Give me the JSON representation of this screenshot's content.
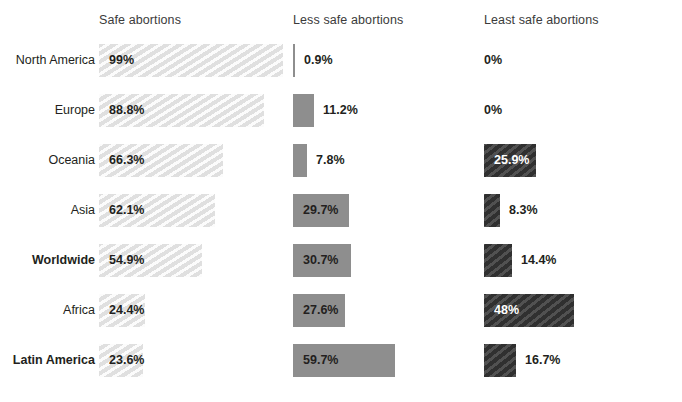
{
  "chart_data": {
    "type": "bar",
    "title": "",
    "subtitle": "",
    "xlabel": "",
    "ylabel": "",
    "orientation": "horizontal",
    "grid": false,
    "legend_position": "top (column headers)",
    "xlim": [
      0,
      100
    ],
    "value_unit": "%",
    "categories": [
      "North America",
      "Europe",
      "Oceania",
      "Asia",
      "Worldwide",
      "Africa",
      "Latin America"
    ],
    "highlighted_categories": [
      "Worldwide",
      "Latin America"
    ],
    "series": [
      {
        "name": "Safe abortions",
        "color": "#e9e9e9",
        "values": [
          99,
          88.8,
          66.3,
          62.1,
          54.9,
          24.4,
          23.6
        ],
        "labels": [
          "99%",
          "88.8%",
          "66.3%",
          "62.1%",
          "54.9%",
          "24.4%",
          "23.6%"
        ]
      },
      {
        "name": "Less safe abortions",
        "color": "#8e8e8e",
        "values": [
          0.9,
          11.2,
          7.8,
          29.7,
          30.7,
          27.6,
          59.7
        ],
        "labels": [
          "0.9%",
          "11.2%",
          "7.8%",
          "29.7%",
          "30.7%",
          "27.6%",
          "59.7%"
        ]
      },
      {
        "name": "Least safe abortions",
        "color": "#3c3c3c",
        "values": [
          0,
          0,
          25.9,
          8.3,
          14.4,
          48,
          16.7
        ],
        "labels": [
          "0%",
          "0%",
          "25.9%",
          "8.3%",
          "14.4%",
          "48%",
          "16.7%"
        ]
      }
    ]
  },
  "headers": {
    "safe": "Safe abortions",
    "less_safe": "Less safe abortions",
    "least_safe": "Least safe abortions"
  },
  "rows": [
    {
      "label": "North America",
      "safe": {
        "value": "99%",
        "width": 184,
        "placement": "inside"
      },
      "less": {
        "value": "0.9%",
        "width": 2,
        "placement": "outside",
        "offset": 11
      },
      "least": {
        "value": "0%",
        "width": 0,
        "placement": "outside",
        "offset": 0
      }
    },
    {
      "label": "Europe",
      "safe": {
        "value": "88.8%",
        "width": 165,
        "placement": "inside"
      },
      "less": {
        "value": "11.2%",
        "width": 21,
        "placement": "outside",
        "offset": 30
      },
      "least": {
        "value": "0%",
        "width": 0,
        "placement": "outside",
        "offset": 0
      }
    },
    {
      "label": "Oceania",
      "safe": {
        "value": "66.3%",
        "width": 124,
        "placement": "inside"
      },
      "less": {
        "value": "7.8%",
        "width": 14,
        "placement": "outside",
        "offset": 23
      },
      "least": {
        "value": "25.9%",
        "width": 52,
        "placement": "inside"
      }
    },
    {
      "label": "Asia",
      "safe": {
        "value": "62.1%",
        "width": 116,
        "placement": "inside"
      },
      "less": {
        "value": "29.7%",
        "width": 56,
        "placement": "inside"
      },
      "least": {
        "value": "8.3%",
        "width": 16,
        "placement": "outside",
        "offset": 25
      }
    },
    {
      "label": "Worldwide",
      "safe": {
        "value": "54.9%",
        "width": 103,
        "placement": "inside"
      },
      "less": {
        "value": "30.7%",
        "width": 58,
        "placement": "inside"
      },
      "least": {
        "value": "14.4%",
        "width": 28,
        "placement": "outside",
        "offset": 37
      }
    },
    {
      "label": "Africa",
      "safe": {
        "value": "24.4%",
        "width": 46,
        "placement": "inside"
      },
      "less": {
        "value": "27.6%",
        "width": 52,
        "placement": "inside"
      },
      "least": {
        "value": "48%",
        "width": 90,
        "placement": "inside"
      }
    },
    {
      "label": "Latin America",
      "safe": {
        "value": "23.6%",
        "width": 44,
        "placement": "inside"
      },
      "less": {
        "value": "59.7%",
        "width": 102,
        "placement": "inside"
      },
      "least": {
        "value": "16.7%",
        "width": 32,
        "placement": "outside",
        "offset": 41
      }
    }
  ]
}
